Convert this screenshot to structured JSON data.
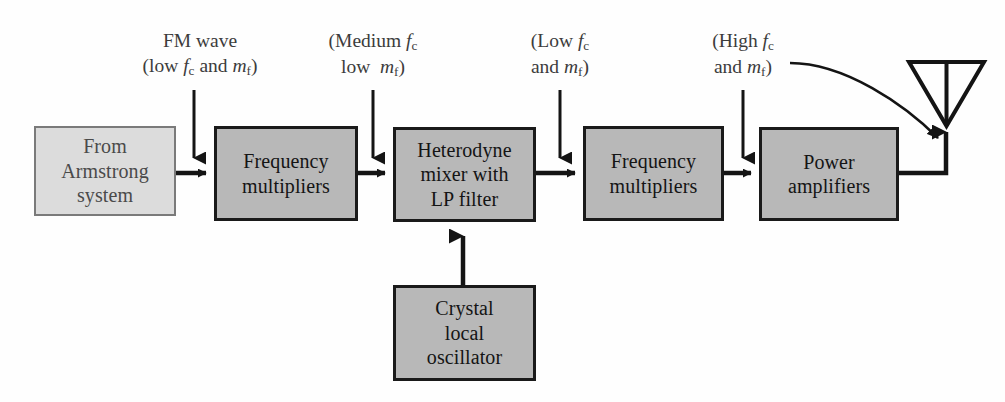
{
  "diagram": {
    "background_color": "#fefefe",
    "shaded_fill": "#b8b8b8",
    "light_fill": "#dcdcdc",
    "line_color": "#141414"
  },
  "blocks": [
    {
      "id": "from-armstrong-system",
      "lines": [
        "From",
        "Armstrong",
        "system"
      ],
      "style": "light",
      "x": 34,
      "y": 126,
      "w": 142,
      "h": 90
    },
    {
      "id": "frequency-multipliers-1",
      "lines": [
        "Frequency",
        "multipliers"
      ],
      "style": "shaded",
      "x": 214,
      "y": 126,
      "w": 144,
      "h": 95
    },
    {
      "id": "heterodyne-mixer",
      "lines": [
        "Heterodyne",
        "mixer with",
        "LP filter"
      ],
      "style": "shaded",
      "x": 393,
      "y": 127,
      "w": 143,
      "h": 95
    },
    {
      "id": "frequency-multipliers-2",
      "lines": [
        "Frequency",
        "multipliers"
      ],
      "style": "shaded",
      "x": 583,
      "y": 126,
      "w": 141,
      "h": 95
    },
    {
      "id": "power-amplifiers",
      "lines": [
        "Power",
        "amplifiers"
      ],
      "style": "shaded",
      "x": 759,
      "y": 127,
      "w": 140,
      "h": 94
    },
    {
      "id": "crystal-local-oscillator",
      "lines": [
        "Crystal",
        "local",
        "oscillator"
      ],
      "style": "shaded",
      "x": 393,
      "y": 285,
      "w": 143,
      "h": 96
    }
  ],
  "annotations": [
    {
      "id": "fm-wave-label",
      "line1_plain": "FM wave",
      "line2_plain": "(low f_c and m_f)",
      "x": 200,
      "y": 28
    },
    {
      "id": "medium-fc-label",
      "line1_plain": "(Medium f_c",
      "line2_plain": "low  m_f)",
      "x": 375,
      "y": 28
    },
    {
      "id": "low-fc-label",
      "line1_plain": "(Low f_c",
      "line2_plain": "and m_f)",
      "x": 560,
      "y": 28
    },
    {
      "id": "high-fc-label",
      "line1_plain": "(High f_c",
      "line2_plain": "and m_f)",
      "x": 740,
      "y": 28
    }
  ],
  "icons": {
    "antenna": "antenna-icon",
    "down_arrow": "down-arrow-icon",
    "right_arrow": "right-arrow-icon",
    "up_arrow": "up-arrow-icon",
    "curved_arrow": "curved-arrow-icon"
  },
  "connectors": [
    {
      "id": "armstrong-to-mult1",
      "type": "right-arrow",
      "from": "from-armstrong-system",
      "to": "frequency-multipliers-1"
    },
    {
      "id": "mult1-to-mixer",
      "type": "right-arrow",
      "from": "frequency-multipliers-1",
      "to": "heterodyne-mixer"
    },
    {
      "id": "mixer-to-mult2",
      "type": "right-arrow",
      "from": "heterodyne-mixer",
      "to": "frequency-multipliers-2"
    },
    {
      "id": "mult2-to-power",
      "type": "right-arrow",
      "from": "frequency-multipliers-2",
      "to": "power-amplifiers"
    },
    {
      "id": "power-to-antenna",
      "type": "line-up-arrow",
      "from": "power-amplifiers",
      "to": "antenna"
    },
    {
      "id": "oscillator-to-mixer",
      "type": "up-arrow",
      "from": "crystal-local-oscillator",
      "to": "heterodyne-mixer"
    },
    {
      "id": "fm-wave-pointer",
      "type": "down-arrow",
      "to": "armstrong-to-mult1"
    },
    {
      "id": "medium-pointer",
      "type": "down-arrow",
      "to": "mult1-to-mixer"
    },
    {
      "id": "low-pointer",
      "type": "down-arrow",
      "to": "mixer-to-mult2"
    },
    {
      "id": "high-pointer",
      "type": "down-arrow",
      "to": "mult2-to-power"
    },
    {
      "id": "high-label-to-antenna",
      "type": "curved-arrow",
      "to": "antenna"
    }
  ]
}
